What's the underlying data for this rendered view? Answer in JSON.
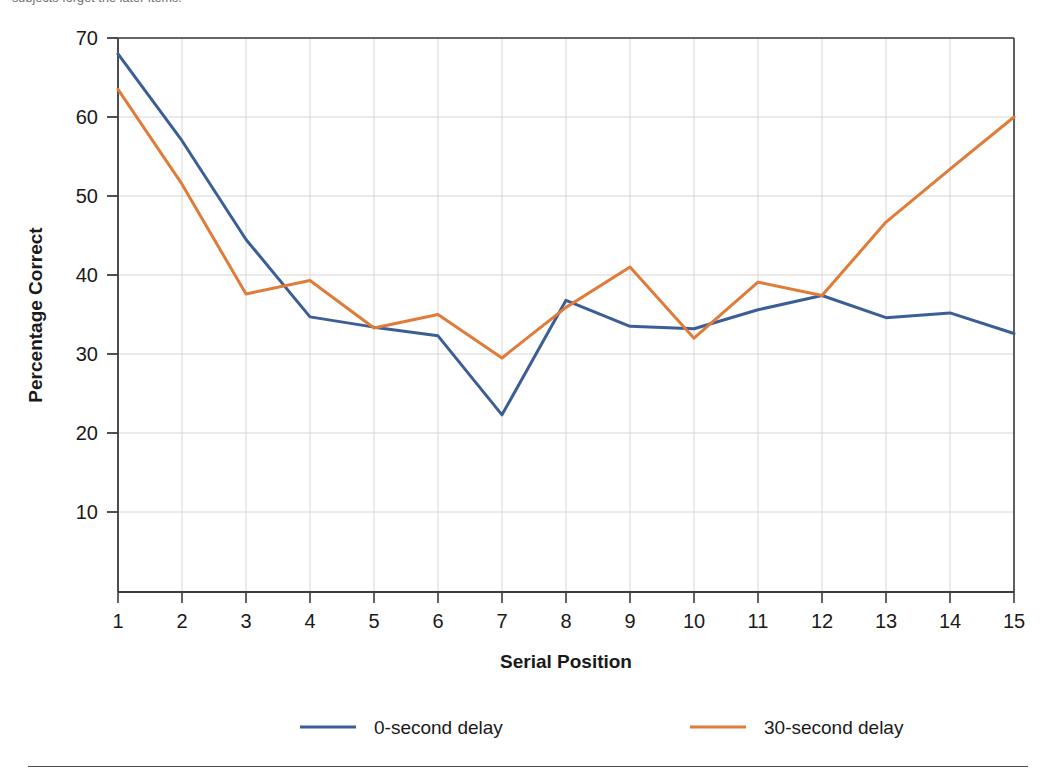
{
  "caption": {
    "text": "subjects forget the later items."
  },
  "chart_data": {
    "type": "line",
    "title": "",
    "xlabel": "Serial Position",
    "ylabel": "Percentage Correct",
    "x": [
      1,
      2,
      3,
      4,
      5,
      6,
      7,
      8,
      9,
      10,
      11,
      12,
      13,
      14,
      15
    ],
    "categories": [
      "1",
      "2",
      "3",
      "4",
      "5",
      "6",
      "7",
      "8",
      "9",
      "10",
      "11",
      "12",
      "13",
      "14",
      "15"
    ],
    "xtick_labels": [
      "1",
      "2",
      "3",
      "4",
      "5",
      "6",
      "7",
      "8",
      "9",
      "10",
      "11",
      "12",
      "13",
      "14",
      "15"
    ],
    "ytick_labels": [
      "10",
      "20",
      "30",
      "40",
      "50",
      "60",
      "70"
    ],
    "yticks": [
      10,
      20,
      30,
      40,
      50,
      60,
      70
    ],
    "xlim": [
      1,
      15
    ],
    "ylim": [
      0,
      70
    ],
    "grid": true,
    "legend_position": "bottom",
    "series": [
      {
        "name": "0-second delay",
        "color": "#3B5E96",
        "values": [
          68.0,
          57.0,
          44.5,
          34.7,
          33.4,
          32.3,
          22.3,
          36.8,
          33.5,
          33.2,
          35.6,
          37.4,
          34.6,
          35.2,
          32.6
        ]
      },
      {
        "name": "30-second delay",
        "color": "#E07B39",
        "values": [
          63.5,
          51.5,
          37.6,
          39.3,
          33.3,
          35.0,
          29.5,
          35.9,
          41.0,
          32.0,
          39.1,
          37.4,
          46.7,
          53.4,
          60.0
        ]
      }
    ]
  },
  "legend": {
    "items": [
      {
        "label": "0-second delay",
        "color": "#3B5E96"
      },
      {
        "label": "30-second delay",
        "color": "#E07B39"
      }
    ]
  }
}
